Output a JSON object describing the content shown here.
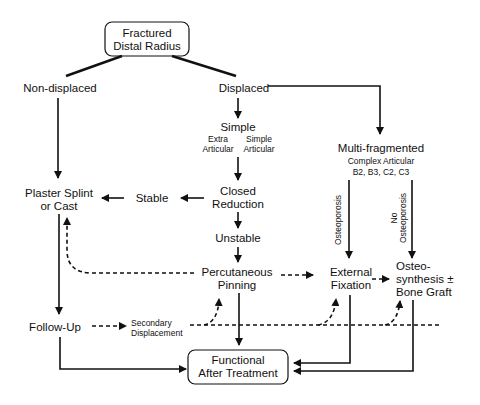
{
  "diagram": {
    "colors": {
      "ink": "#111111",
      "background": "#ffffff"
    },
    "nodes": {
      "root": {
        "line1": "Fractured",
        "line2": "Distal Radius"
      },
      "non_displaced": "Non-displaced",
      "displaced": "Displaced",
      "simple": {
        "title": "Simple",
        "sub_left_1": "Extra",
        "sub_left_2": "Articular",
        "sub_right_1": "Simple",
        "sub_right_2": "Articular"
      },
      "multi": {
        "title": "Multi-fragmented",
        "sub1": "Complex Articular",
        "sub2": "B2, B3, C2, C3"
      },
      "plaster": {
        "line1": "Plaster Splint",
        "line2": "or Cast"
      },
      "stable": "Stable",
      "closed_reduction": {
        "line1": "Closed",
        "line2": "Reduction"
      },
      "unstable": "Unstable",
      "pinning": {
        "line1": "Percutaneous",
        "line2": "Pinning"
      },
      "ext_fix": {
        "line1": "External",
        "line2": "Fixation"
      },
      "osteosynthesis": {
        "line1": "Osteo-",
        "line2": "synthesis ±",
        "line3": "Bone Graft"
      },
      "follow_up": "Follow-Up",
      "secondary": {
        "line1": "Secondary",
        "line2": "Displacement"
      },
      "functional": {
        "line1": "Functional",
        "line2": "After Treatment"
      }
    },
    "edge_labels": {
      "osteoporosis": "Osteoporosis",
      "no_osteoporosis_1": "No",
      "no_osteoporosis_2": "Osteoporosis"
    }
  }
}
